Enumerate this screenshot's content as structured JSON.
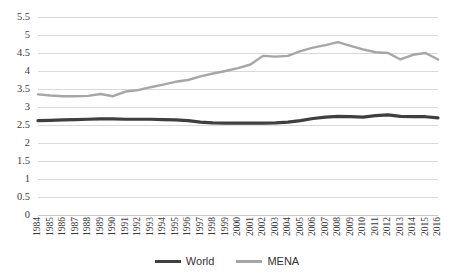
{
  "chart_data": {
    "type": "line",
    "title": "",
    "subtitle": "",
    "xlabel": "",
    "ylabel": "",
    "grid": true,
    "legend_position": "bottom",
    "ylim": [
      0,
      5.5
    ],
    "yticks": [
      "0",
      "0.5",
      "1",
      "1.5",
      "2",
      "2.5",
      "3",
      "3.5",
      "4",
      "4.5",
      "5",
      "5.5"
    ],
    "ytick_values": [
      0,
      0.5,
      1,
      1.5,
      2,
      2.5,
      3,
      3.5,
      4,
      4.5,
      5,
      5.5
    ],
    "x": [
      "1984",
      "1985",
      "1986",
      "1987",
      "1988",
      "1989",
      "1990",
      "1991",
      "1992",
      "1993",
      "1994",
      "1995",
      "1996",
      "1997",
      "1998",
      "1999",
      "2000",
      "2001",
      "2002",
      "2003",
      "2004",
      "2005",
      "2006",
      "2007",
      "2008",
      "2009",
      "2010",
      "2011",
      "2012",
      "2013",
      "2014",
      "2015",
      "2016"
    ],
    "categories": [
      "1984",
      "1985",
      "1986",
      "1987",
      "1988",
      "1989",
      "1990",
      "1991",
      "1992",
      "1993",
      "1994",
      "1995",
      "1996",
      "1997",
      "1998",
      "1999",
      "2000",
      "2001",
      "2002",
      "2003",
      "2004",
      "2005",
      "2006",
      "2007",
      "2008",
      "2009",
      "2010",
      "2011",
      "2012",
      "2013",
      "2014",
      "2015",
      "2016"
    ],
    "series": [
      {
        "name": "World",
        "color": "#3f3f3f",
        "values": [
          2.62,
          2.63,
          2.64,
          2.65,
          2.66,
          2.67,
          2.67,
          2.66,
          2.66,
          2.66,
          2.65,
          2.64,
          2.62,
          2.58,
          2.56,
          2.55,
          2.55,
          2.55,
          2.55,
          2.56,
          2.58,
          2.62,
          2.68,
          2.72,
          2.74,
          2.73,
          2.72,
          2.76,
          2.78,
          2.74,
          2.73,
          2.73,
          2.7
        ]
      },
      {
        "name": "MENA",
        "color": "#a6a6a6",
        "values": [
          3.35,
          3.32,
          3.3,
          3.3,
          3.31,
          3.36,
          3.3,
          3.43,
          3.47,
          3.55,
          3.62,
          3.7,
          3.75,
          3.85,
          3.93,
          4.0,
          4.08,
          4.18,
          4.42,
          4.4,
          4.42,
          4.55,
          4.65,
          4.72,
          4.8,
          4.7,
          4.6,
          4.52,
          4.5,
          4.32,
          4.45,
          4.5,
          4.32
        ]
      }
    ]
  },
  "legend": {
    "items": [
      {
        "label": "World",
        "color": "#3f3f3f"
      },
      {
        "label": "MENA",
        "color": "#a6a6a6"
      }
    ]
  }
}
